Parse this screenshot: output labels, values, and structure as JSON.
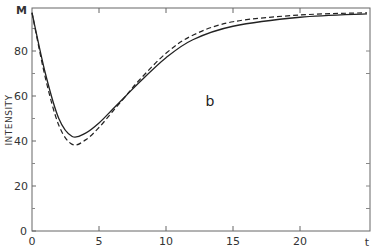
{
  "chart_data": {
    "type": "line",
    "title": "",
    "panel_label": "b",
    "xlabel": "t",
    "ylabel": "INTENSITY",
    "xlim": [
      0,
      25
    ],
    "ylim": [
      0,
      99
    ],
    "grid": false,
    "legend": null,
    "x_ticks": [
      0,
      5,
      10,
      15,
      20
    ],
    "y_ticks": [
      0,
      20,
      40,
      60,
      80
    ],
    "y_top_label": "M",
    "y_top_value": 97,
    "x": [
      0,
      1,
      2,
      3,
      4,
      5,
      6,
      7,
      8,
      10,
      12,
      15,
      20,
      25
    ],
    "series": [
      {
        "name": "solid",
        "style": "solid",
        "values": [
          97,
          70,
          50,
          42,
          43.5,
          48,
          54,
          60,
          66,
          77,
          85,
          91,
          95,
          96.5
        ]
      },
      {
        "name": "dashed",
        "style": "dashed",
        "values": [
          97,
          68,
          47,
          38.5,
          40.5,
          46,
          53,
          60,
          67,
          79,
          87,
          93,
          96,
          97
        ]
      }
    ]
  },
  "labels": {
    "x_axis_var": "t",
    "y_axis_title": "INTENSITY",
    "y_top": "M",
    "panel": "b"
  },
  "colors": {
    "line": "#222222",
    "axis": "#555555"
  }
}
